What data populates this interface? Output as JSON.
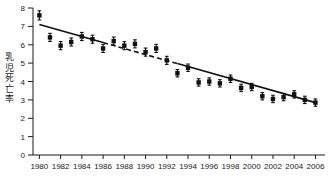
{
  "chart_data": {
    "type": "scatter",
    "title": "",
    "subtitle": "",
    "xlabel": "",
    "ylabel": "乳児死亡率",
    "xlim": [
      1979.4,
      2006.9
    ],
    "ylim": [
      0,
      8
    ],
    "grid": false,
    "legend": null,
    "x_tick_labels": [
      "1980",
      "1982",
      "1984",
      "1986",
      "1988",
      "1990",
      "1992",
      "1994",
      "1996",
      "1998",
      "2000",
      "2002",
      "2004",
      "2006"
    ],
    "x_tick_values": [
      1980,
      1982,
      1984,
      1986,
      1988,
      1990,
      1992,
      1994,
      1996,
      1998,
      2000,
      2002,
      2004,
      2006
    ],
    "y_tick_labels": [
      "0",
      "1",
      "2",
      "3",
      "4",
      "5",
      "6",
      "7",
      "8"
    ],
    "y_tick_values": [
      0,
      1,
      2,
      3,
      4,
      5,
      6,
      7,
      8
    ],
    "x": [
      1980,
      1981,
      1982,
      1983,
      1984,
      1985,
      1986,
      1987,
      1988,
      1989,
      1990,
      1991,
      1992,
      1993,
      1994,
      1995,
      1996,
      1997,
      1998,
      1999,
      2000,
      2001,
      2002,
      2003,
      2004,
      2005,
      2006
    ],
    "values": [
      7.6,
      6.4,
      5.95,
      6.15,
      6.45,
      6.3,
      5.8,
      6.2,
      5.95,
      6.05,
      5.6,
      5.8,
      5.15,
      4.45,
      4.75,
      3.95,
      4.0,
      3.9,
      4.15,
      3.65,
      3.7,
      3.2,
      3.05,
      3.15,
      3.3,
      3.0,
      2.85
    ],
    "error_bars": [
      0.25,
      0.22,
      0.22,
      0.22,
      0.22,
      0.22,
      0.22,
      0.22,
      0.22,
      0.22,
      0.22,
      0.22,
      0.22,
      0.2,
      0.2,
      0.2,
      0.2,
      0.2,
      0.2,
      0.2,
      0.2,
      0.2,
      0.2,
      0.2,
      0.2,
      0.2,
      0.2
    ],
    "marker": "filled-square",
    "marker_color": "#111111",
    "fit_line": {
      "style_note": "solid-dashed-solid trend line",
      "x_start": 1980,
      "y_start": 7.1,
      "x_end": 2006,
      "y_end": 2.85,
      "dashed_segment_x": [
        1986,
        1993
      ],
      "color": "#111111"
    }
  },
  "axes": {
    "y_axis_title": "乳児死亡率",
    "y_axis_title_chars": [
      "乳",
      "児",
      "死",
      "亡",
      "率"
    ]
  }
}
